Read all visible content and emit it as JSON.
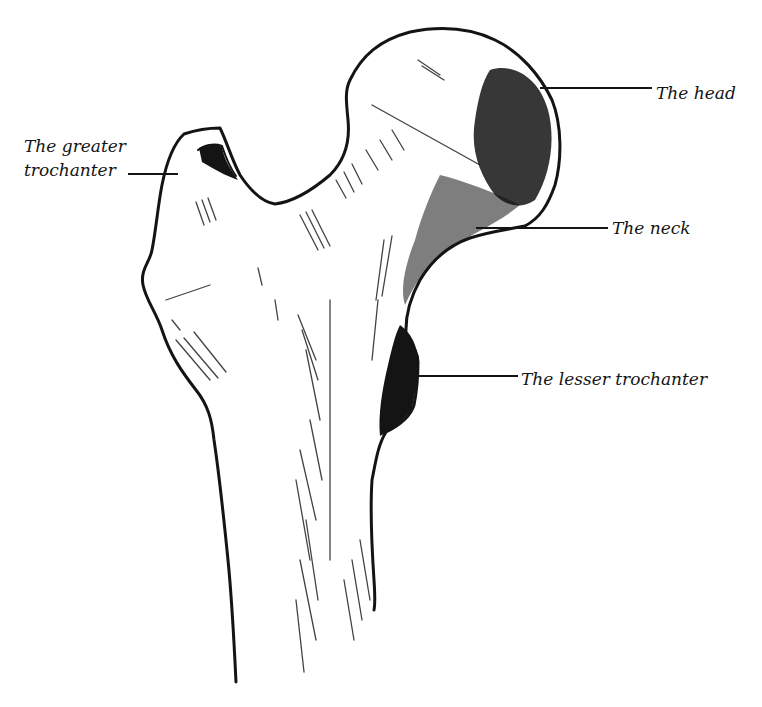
{
  "figure": {
    "ink_color": "#141414",
    "background": "#ffffff"
  },
  "labels": [
    {
      "id": "greater-trochanter",
      "lines": [
        "The greater",
        "trochanter"
      ],
      "leader_to": "greater trochanter"
    },
    {
      "id": "head",
      "lines": [
        "The head"
      ],
      "leader_to": "femoral head"
    },
    {
      "id": "neck",
      "lines": [
        "The neck"
      ],
      "leader_to": "femoral neck"
    },
    {
      "id": "lesser-trochanter",
      "lines": [
        "The lesser trochanter"
      ],
      "leader_to": "lesser trochanter"
    }
  ]
}
